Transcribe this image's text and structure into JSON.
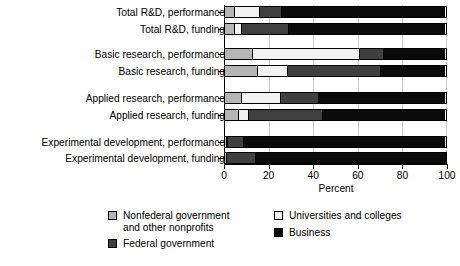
{
  "chart_data": {
    "type": "bar",
    "orientation": "horizontal",
    "stacked": true,
    "title": "",
    "xlabel": "Percent",
    "ylabel": "",
    "xlim": [
      0,
      100
    ],
    "xticks": [
      0,
      20,
      40,
      60,
      80,
      100
    ],
    "xtick_labels": [
      "0",
      "20",
      "40",
      "60",
      "80",
      "100"
    ],
    "grid": "vertical",
    "legend_position": "bottom",
    "categories": [
      "Total R&D, performance",
      "Total R&D, funding",
      "Basic research, performance",
      "Basic research, funding",
      "Applied research, performance",
      "Applied research, funding",
      "Experimental development, performance",
      "Experimental development, funding"
    ],
    "series": [
      {
        "name": "Nonfederal government and other nonprofits",
        "color": "#b5b5b5",
        "values": [
          4.5,
          4.5,
          12.5,
          15.0,
          7.5,
          6.5,
          1.0,
          1.0
        ]
      },
      {
        "name": "Universities and colleges",
        "color": "#f2f2f2",
        "values": [
          11.5,
          3.5,
          48.5,
          13.5,
          18.0,
          4.5,
          1.0,
          0.0
        ]
      },
      {
        "name": "Federal government",
        "color": "#3f3f3f",
        "values": [
          10.5,
          21.5,
          11.0,
          42.5,
          17.5,
          34.0,
          7.5,
          13.5
        ]
      },
      {
        "name": "Business",
        "color": "#0b0b0b",
        "values": [
          73.5,
          70.5,
          28.0,
          29.0,
          57.0,
          55.0,
          90.5,
          85.5
        ]
      }
    ]
  },
  "legend": {
    "entries": [
      {
        "label": "Nonfederal government\nand other nonprofits",
        "color": "#b5b5b5"
      },
      {
        "label": "Universities and colleges",
        "color": "#f2f2f2"
      },
      {
        "label": "Federal government",
        "color": "#3f3f3f"
      },
      {
        "label": "Business",
        "color": "#0b0b0b"
      }
    ]
  }
}
